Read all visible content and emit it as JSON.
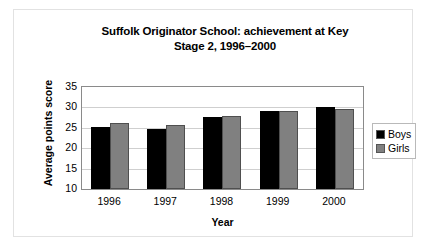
{
  "chart_data": {
    "type": "bar",
    "title": "Suffolk Originator School: achievement at Key Stage 2, 1996–2000",
    "title_line1": "Suffolk Originator School: achievement at Key",
    "title_line2": "Stage 2, 1996–2000",
    "xlabel": "Year",
    "ylabel": "Average points score",
    "categories": [
      "1996",
      "1997",
      "1998",
      "1999",
      "2000"
    ],
    "series": [
      {
        "name": "Boys",
        "color": "#000000",
        "values": [
          25.1,
          24.6,
          27.7,
          29.2,
          30.0
        ]
      },
      {
        "name": "Girls",
        "color": "#808080",
        "values": [
          26.2,
          25.8,
          27.8,
          29.0,
          29.5
        ]
      }
    ],
    "ylim": [
      10,
      35
    ],
    "ytick_step": 5,
    "yticks": [
      "35",
      "30",
      "25",
      "20",
      "15",
      "10"
    ],
    "grid": true,
    "legend_position": "right"
  },
  "legend": {
    "items": [
      {
        "label": "Boys",
        "swatch": "#000000"
      },
      {
        "label": "Girls",
        "swatch": "#808080"
      }
    ]
  }
}
